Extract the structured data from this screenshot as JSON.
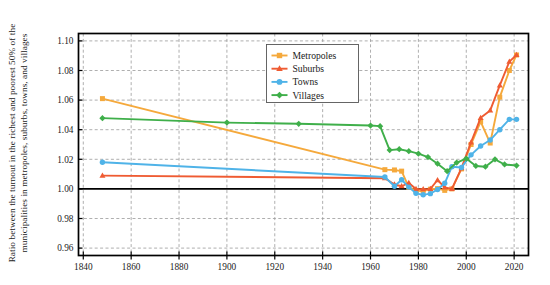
{
  "chart_data": {
    "type": "line",
    "title": "",
    "xlabel": "",
    "ylabel_line1": "Ratio between the turnout in the richest and poorest 50% of the",
    "ylabel_line2": "municipalities in metropoles, suburbs, towns, and villages",
    "xlim": [
      1838,
      2026
    ],
    "ylim": [
      0.955,
      1.105
    ],
    "xticks": [
      1840,
      1860,
      1880,
      1900,
      1920,
      1940,
      1960,
      1980,
      2000,
      2020
    ],
    "yticks": [
      0.96,
      0.98,
      1.0,
      1.02,
      1.04,
      1.06,
      1.08,
      1.1
    ],
    "ytick_labels": [
      "0.96",
      "0.98",
      "1.00",
      "1.02",
      "1.04",
      "1.06",
      "1.08",
      "1.10"
    ],
    "xtick_labels": [
      "1840",
      "1860",
      "1880",
      "1900",
      "1920",
      "1940",
      "1960",
      "1980",
      "2000",
      "2020"
    ],
    "grid": true,
    "grid_style": "dashed",
    "reference_line_y": 1.0,
    "legend_position": "upper-center-left",
    "series": [
      {
        "name": "Metropoles",
        "color": "#f5a93c",
        "marker": "square",
        "x": [
          1848,
          1966,
          1970,
          1973,
          1976,
          1979,
          1982,
          1985,
          1988,
          1991,
          1994,
          1998,
          2002,
          2006,
          2010,
          2014,
          2018,
          2021
        ],
        "y": [
          1.061,
          1.013,
          1.0128,
          1.012,
          1.001,
          0.9988,
          0.9986,
          0.9998,
          1.0002,
          0.999,
          1.0,
          1.0135,
          1.03,
          1.0455,
          1.031,
          1.062,
          1.08,
          1.0905
        ]
      },
      {
        "name": "Suburbs",
        "color": "#ef5b32",
        "marker": "triangle",
        "x": [
          1848,
          1966,
          1970,
          1973,
          1976,
          1979,
          1982,
          1985,
          1988,
          1991,
          1994,
          1998,
          2002,
          2006,
          2010,
          2014,
          2018,
          2021
        ],
        "y": [
          1.009,
          1.0072,
          1.003,
          1.0018,
          1.004,
          1.0,
          0.9998,
          1.0,
          1.006,
          1.001,
          1.0,
          1.014,
          1.0315,
          1.048,
          1.053,
          1.07,
          1.086,
          1.0905
        ]
      },
      {
        "name": "Towns",
        "color": "#4fb3e8",
        "marker": "circle",
        "x": [
          1848,
          1966,
          1970,
          1973,
          1976,
          1979,
          1982,
          1985,
          1988,
          1991,
          1994,
          1998,
          2002,
          2006,
          2010,
          2014,
          2018,
          2021
        ],
        "y": [
          1.018,
          1.008,
          1.0018,
          1.0062,
          1.0012,
          0.997,
          0.996,
          0.9968,
          0.9996,
          1.0038,
          1.015,
          1.0145,
          1.023,
          1.029,
          1.033,
          1.04,
          1.047,
          1.047
        ]
      },
      {
        "name": "Villages",
        "color": "#3faf4a",
        "marker": "diamond",
        "x": [
          1848,
          1900,
          1930,
          1960,
          1964,
          1968,
          1972,
          1976,
          1980,
          1984,
          1988,
          1992,
          1996,
          2000,
          2004,
          2008,
          2012,
          2016,
          2021
        ],
        "y": [
          1.0478,
          1.0448,
          1.044,
          1.0428,
          1.0424,
          1.0262,
          1.0268,
          1.0255,
          1.0238,
          1.0215,
          1.017,
          1.012,
          1.0178,
          1.0205,
          1.0155,
          1.015,
          1.02,
          1.0165,
          1.0158
        ]
      }
    ]
  },
  "legend": {
    "items": [
      {
        "label": "Metropoles"
      },
      {
        "label": "Suburbs"
      },
      {
        "label": "Towns"
      },
      {
        "label": "Villages"
      }
    ]
  }
}
